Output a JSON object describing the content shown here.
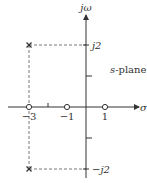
{
  "diagram": {
    "type": "s-plane pole-zero plot",
    "plane_label_var": "s",
    "plane_label_text": "-plane",
    "axes": {
      "vertical_label": "jω",
      "horizontal_label": "σ"
    },
    "real_tick_labels": [
      {
        "value": -3,
        "text": "−3"
      },
      {
        "value": -1,
        "text": "−1"
      },
      {
        "value": 1,
        "text": "1"
      }
    ],
    "real_ticks_unlabeled": [
      -2
    ],
    "imag_tick_labels": [
      {
        "value": 2,
        "text": "j2"
      },
      {
        "value": -2,
        "text": "−j2"
      }
    ],
    "imag_ticks_unlabeled": [
      1,
      -1
    ],
    "zeros": [
      {
        "re": -3,
        "im": 0
      },
      {
        "re": -1,
        "im": 0
      },
      {
        "re": 1,
        "im": 0
      }
    ],
    "poles": [
      {
        "re": -3,
        "im": 2
      },
      {
        "re": -3,
        "im": -2
      }
    ],
    "guide_lines": "dashed lines connect each pole to both axes"
  }
}
